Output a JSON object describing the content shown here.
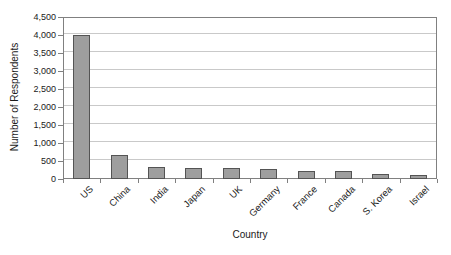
{
  "chart_data": {
    "type": "bar",
    "title": "",
    "xlabel": "Country",
    "ylabel": "Number of Respondents",
    "categories": [
      "US",
      "China",
      "India",
      "Japan",
      "UK",
      "Germany",
      "France",
      "Canada",
      "S. Korea",
      "Israel"
    ],
    "values": [
      4000,
      670,
      340,
      295,
      300,
      280,
      220,
      210,
      150,
      110
    ],
    "ylim": [
      0,
      4500
    ],
    "ytick_step": 500,
    "ytick_labels": [
      "0",
      "500",
      "1,000",
      "1,500",
      "2,000",
      "2,500",
      "3,000",
      "3,500",
      "4,000",
      "4,500"
    ],
    "grid": "horizontal",
    "legend_position": "none",
    "bar_color": "#9e9e9e",
    "bar_border_color": "#545454",
    "gridline_color": "#c9c9c9",
    "axis_color": "#808080",
    "text_color": "#1a1a1a"
  }
}
